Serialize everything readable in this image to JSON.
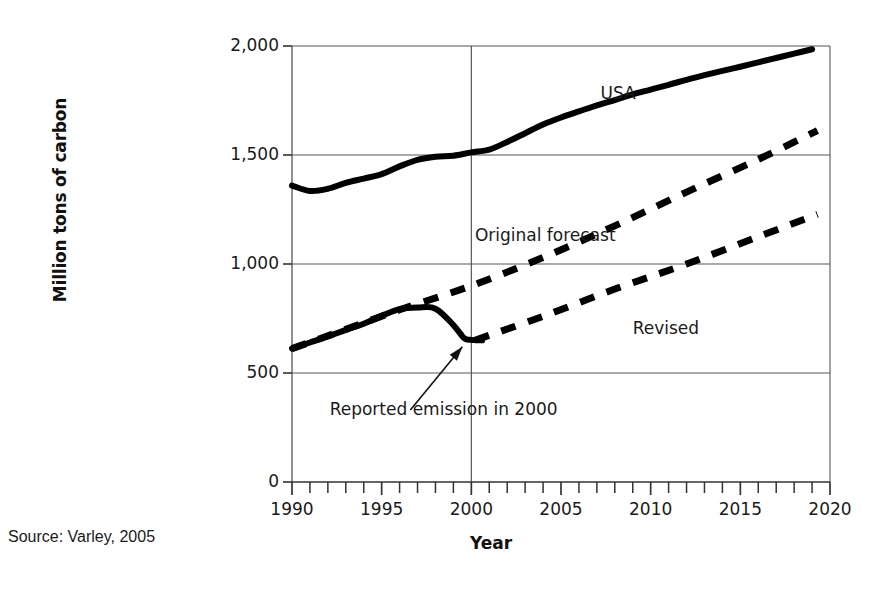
{
  "figure": {
    "source_note": "Source: Varley, 2005",
    "axis_label_x": "Year",
    "axis_label_y": "Million tons of carbon"
  },
  "chart_data": {
    "type": "line",
    "title": "",
    "xlabel": "Year",
    "ylabel": "Million tons of carbon",
    "xlim": [
      1990,
      2020
    ],
    "ylim": [
      0,
      2000
    ],
    "xticks": [
      1990,
      1995,
      2000,
      2005,
      2010,
      2015,
      2020
    ],
    "xtick_labels": [
      "1990",
      "1995",
      "2000",
      "2005",
      "2010",
      "2015",
      "2020"
    ],
    "yticks": [
      0,
      500,
      1000,
      1500,
      2000
    ],
    "ytick_labels": [
      "0",
      "500",
      "1,000",
      "1,500",
      "2,000"
    ],
    "minor_xtick_interval": 1,
    "grid": "horizontal-at-yticks-plus-vertical-at-2000",
    "legend": "inline-labels",
    "series": [
      {
        "name": "USA",
        "style": "solid",
        "label": "USA",
        "label_x": 2007.2,
        "label_y": 1780,
        "points": [
          [
            1990,
            1360
          ],
          [
            1991,
            1335
          ],
          [
            1992,
            1345
          ],
          [
            1993,
            1372
          ],
          [
            1994,
            1392
          ],
          [
            1995,
            1412
          ],
          [
            1996,
            1448
          ],
          [
            1997,
            1478
          ],
          [
            1998,
            1492
          ],
          [
            1999,
            1497
          ],
          [
            2000,
            1512
          ],
          [
            2001,
            1525
          ],
          [
            2002,
            1560
          ],
          [
            2003,
            1600
          ],
          [
            2004,
            1640
          ],
          [
            2005,
            1672
          ],
          [
            2006,
            1700
          ],
          [
            2007,
            1728
          ],
          [
            2008,
            1752
          ],
          [
            2009,
            1778
          ],
          [
            2010,
            1800
          ],
          [
            2011,
            1822
          ],
          [
            2012,
            1845
          ],
          [
            2013,
            1866
          ],
          [
            2014,
            1886
          ],
          [
            2015,
            1905
          ],
          [
            2016,
            1925
          ],
          [
            2017,
            1945
          ],
          [
            2018,
            1965
          ],
          [
            2019,
            1985
          ]
        ]
      },
      {
        "name": "Reported emission",
        "style": "solid",
        "label": "",
        "points": [
          [
            1990,
            612
          ],
          [
            1991,
            640
          ],
          [
            1992,
            668
          ],
          [
            1993,
            698
          ],
          [
            1994,
            726
          ],
          [
            1995,
            762
          ],
          [
            1996,
            793
          ],
          [
            1997,
            800
          ],
          [
            1998,
            795
          ],
          [
            1999,
            720
          ],
          [
            1999.6,
            660
          ],
          [
            2000,
            652
          ],
          [
            2000.6,
            650
          ]
        ]
      },
      {
        "name": "Original forecast",
        "style": "dashed",
        "label": "Original forecast",
        "label_x": 2000.2,
        "label_y": 1128,
        "points": [
          [
            1990,
            612
          ],
          [
            1993,
            700
          ],
          [
            1996,
            790
          ],
          [
            2000,
            900
          ],
          [
            2004,
            1030
          ],
          [
            2008,
            1175
          ],
          [
            2012,
            1330
          ],
          [
            2016,
            1480
          ],
          [
            2019.3,
            1612
          ]
        ]
      },
      {
        "name": "Revised",
        "style": "dashed",
        "label": "Revised",
        "label_x": 2009.0,
        "label_y": 700,
        "points": [
          [
            2000.2,
            650
          ],
          [
            2004,
            760
          ],
          [
            2008,
            885
          ],
          [
            2012,
            1000
          ],
          [
            2016,
            1125
          ],
          [
            2019.3,
            1228
          ]
        ]
      }
    ],
    "annotations": [
      {
        "text": "Reported emission in 2000",
        "text_x": 1992.1,
        "text_y": 330,
        "arrow_from": [
          1996.6,
          330
        ],
        "arrow_to": [
          1999.5,
          620
        ]
      }
    ]
  }
}
